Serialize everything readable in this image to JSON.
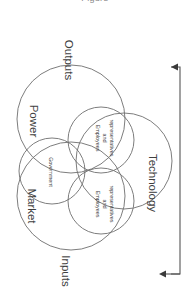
{
  "figure": {
    "type": "venn-diagram",
    "orientation_degrees": 90,
    "clipped_caption": "Figure",
    "background_color": "#ffffff",
    "stroke_color": "#6e6e6e",
    "text_color": "#3f3f3f"
  },
  "flow": {
    "input_label": "Inputs",
    "output_label": "Outputs",
    "feedback_arrow_top": "arrow-left-icon",
    "feedback_arrow_bottom": "arrow-left-icon"
  },
  "outer_sets": [
    {
      "label": "Power"
    },
    {
      "label": "Market"
    },
    {
      "label": "Technology"
    }
  ],
  "inner_sets": [
    {
      "label_line1": "Government",
      "label_line2": "",
      "label_line3": ""
    },
    {
      "label_line1": "Employees",
      "label_line2": "and",
      "label_line3": "representatives"
    },
    {
      "label_line1": "Employees",
      "label_line2": "and",
      "label_line3": "representatives"
    }
  ]
}
